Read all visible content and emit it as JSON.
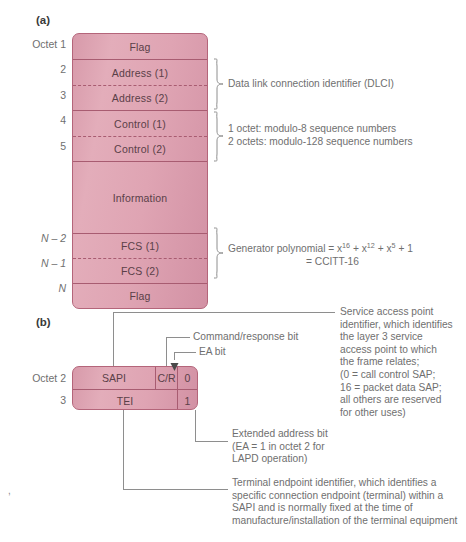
{
  "figure": {
    "panel_a_label": "(a)",
    "panel_b_label": "(b)"
  },
  "frame_a": {
    "octet_labels": {
      "o1": "Octet 1",
      "o2": "2",
      "o3": "3",
      "o4": "4",
      "o5": "5",
      "n2": "N – 2",
      "n1": "N – 1",
      "n": "N"
    },
    "fields": [
      {
        "name": "Flag"
      },
      {
        "name": "Address (1)"
      },
      {
        "name": "Address (2)"
      },
      {
        "name": "Control (1)"
      },
      {
        "name": "Control (2)"
      },
      {
        "name": "Information"
      },
      {
        "name": "FCS (1)"
      },
      {
        "name": "FCS (2)"
      },
      {
        "name": "Flag"
      }
    ],
    "annotations": {
      "dlci": "Data link connection identifier (DLCI)",
      "control_line1": "1 octet: modulo-8 sequence numbers",
      "control_line2": "2 octets: modulo-128 sequence numbers",
      "fcs_line1_prefix": "Generator polynomial = x",
      "fcs_exp1": "16",
      "fcs_mid1": " + x",
      "fcs_exp2": "12",
      "fcs_mid2": " + x",
      "fcs_exp3": "5",
      "fcs_tail": " + 1",
      "fcs_line2": "= CCITT-16"
    }
  },
  "frame_b": {
    "octet_labels": {
      "o2": "Octet 2",
      "o3": "3"
    },
    "cells": {
      "sapi": "SAPI",
      "cr": "C/R",
      "ea_row1": "0",
      "tei": "TEI",
      "ea_row2": "1"
    },
    "callouts": {
      "command_response": "Command/response bit",
      "ea_bit": "EA bit",
      "sapi_desc": [
        "Service access point",
        "identifier, which identifies",
        "the layer 3 service",
        "access point to which",
        "the frame relates;",
        "(0 = call control SAP;",
        "16 = packet data SAP;",
        "all others are reserved",
        "for other uses)"
      ],
      "ea_desc": [
        "Extended address bit",
        "(EA = 1 in octet 2 for",
        "LAPD operation)"
      ],
      "tei_desc": [
        "Terminal endpoint identifier, which identifies a",
        "specific connection endpoint (terminal) within a",
        "SAPI and is normally fixed at the time of",
        "manufacture/installation of the terminal equipment"
      ]
    }
  },
  "colors": {
    "fill_light": "#e3adba",
    "fill_dark": "#d291a4",
    "border": "#b4657a",
    "text": "#6f6f6f",
    "field_text": "#5a4048"
  }
}
